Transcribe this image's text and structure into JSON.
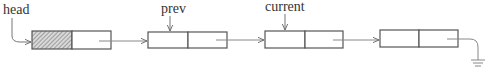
{
  "diagram": {
    "type": "singly-linked-list",
    "labels": {
      "head": "head",
      "prev": "prev",
      "current": "current"
    },
    "nodes": [
      {
        "id": "node-0",
        "role": "head sentinel",
        "data_field": "hatched"
      },
      {
        "id": "node-1",
        "pointer_label": "prev"
      },
      {
        "id": "node-2",
        "pointer_label": "current"
      },
      {
        "id": "node-3",
        "next": "null (ground symbol)"
      }
    ],
    "colors": {
      "stroke": "#555555",
      "text": "#333333",
      "hatch": "#888888"
    }
  }
}
